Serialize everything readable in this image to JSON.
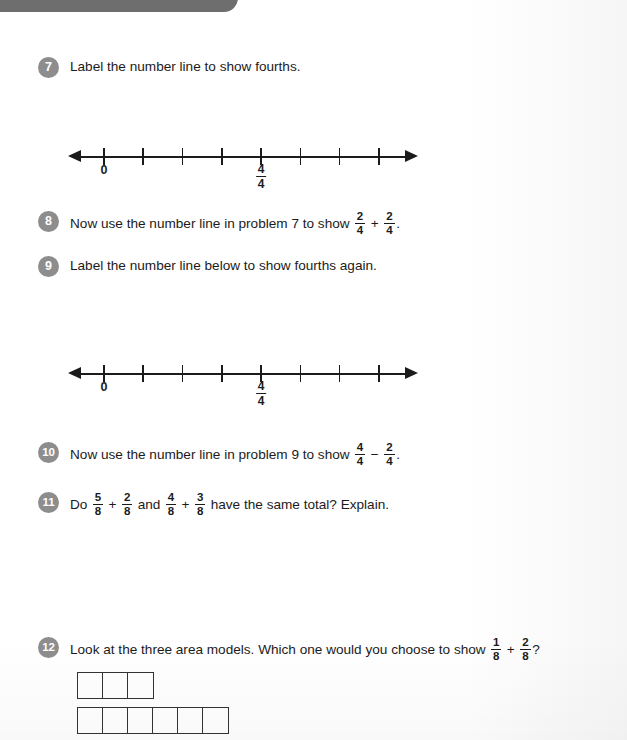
{
  "page": {
    "ink_color": "#1b1b1b",
    "badge_color": "#8d8d8d",
    "smudge_color": "#6e6e6e"
  },
  "problems": [
    {
      "number": "7",
      "parts": [
        {
          "kind": "text",
          "value": "Label the number line to show fourths."
        }
      ]
    },
    {
      "number": "8",
      "parts": [
        {
          "kind": "text",
          "value": "Now use the number line in problem 7 to show "
        },
        {
          "kind": "fraction",
          "numerator": "2",
          "denominator": "4"
        },
        {
          "kind": "op",
          "value": "+"
        },
        {
          "kind": "fraction",
          "numerator": "2",
          "denominator": "4"
        },
        {
          "kind": "text",
          "value": "."
        }
      ]
    },
    {
      "number": "9",
      "parts": [
        {
          "kind": "text",
          "value": "Label the number line below to show fourths again."
        }
      ]
    },
    {
      "number": "10",
      "parts": [
        {
          "kind": "text",
          "value": "Now use the number line in problem 9 to show "
        },
        {
          "kind": "fraction",
          "numerator": "4",
          "denominator": "4"
        },
        {
          "kind": "op",
          "value": "−"
        },
        {
          "kind": "fraction",
          "numerator": "2",
          "denominator": "4"
        },
        {
          "kind": "text",
          "value": "."
        }
      ]
    },
    {
      "number": "11",
      "parts": [
        {
          "kind": "text",
          "value": "Do "
        },
        {
          "kind": "fraction",
          "numerator": "5",
          "denominator": "8"
        },
        {
          "kind": "op",
          "value": "+"
        },
        {
          "kind": "fraction",
          "numerator": "2",
          "denominator": "8"
        },
        {
          "kind": "text",
          "value": " and "
        },
        {
          "kind": "fraction",
          "numerator": "4",
          "denominator": "8"
        },
        {
          "kind": "op",
          "value": "+"
        },
        {
          "kind": "fraction",
          "numerator": "3",
          "denominator": "8"
        },
        {
          "kind": "text",
          "value": " have the same total? Explain."
        }
      ]
    },
    {
      "number": "12",
      "parts": [
        {
          "kind": "text",
          "value": "Look at the three area models. Which one would you choose to show "
        },
        {
          "kind": "fraction",
          "numerator": "1",
          "denominator": "8"
        },
        {
          "kind": "op",
          "value": "+"
        },
        {
          "kind": "fraction",
          "numerator": "2",
          "denominator": "8"
        },
        {
          "kind": "text",
          "value": "?"
        }
      ]
    }
  ],
  "number_lines": [
    {
      "id": "number-line-problem-7",
      "tick_count": 8,
      "labels": [
        {
          "tick_index": 0,
          "kind": "text",
          "value": "0"
        },
        {
          "tick_index": 4,
          "kind": "fraction",
          "numerator": "4",
          "denominator": "4"
        }
      ]
    },
    {
      "id": "number-line-problem-9",
      "tick_count": 8,
      "labels": [
        {
          "tick_index": 0,
          "kind": "text",
          "value": "0"
        },
        {
          "tick_index": 4,
          "kind": "fraction",
          "numerator": "4",
          "denominator": "4"
        }
      ]
    }
  ],
  "area_models": [
    {
      "id": "area-model-1",
      "cells": 3,
      "shaded": 0
    },
    {
      "id": "area-model-2",
      "cells": 6,
      "shaded": 0
    }
  ]
}
